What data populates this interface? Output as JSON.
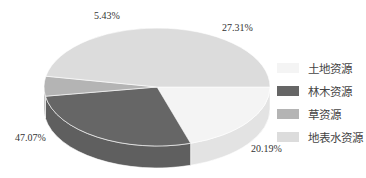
{
  "chart_data": {
    "type": "pie",
    "style": "3d",
    "title": "",
    "categories": [
      "土地资源",
      "林木资源",
      "草资源",
      "地表水资源"
    ],
    "values": [
      20.19,
      27.31,
      5.43,
      47.07
    ],
    "labels": [
      "20.19%",
      "27.31%",
      "5.43%",
      "47.07%"
    ],
    "colors": [
      "#f4f4f4",
      "#666666",
      "#b4b4b4",
      "#dcdcdc"
    ],
    "legend_position": "right"
  },
  "legend": {
    "items": [
      {
        "label": "土地资源",
        "color": "#f4f4f4"
      },
      {
        "label": "林木资源",
        "color": "#666666"
      },
      {
        "label": "草资源",
        "color": "#b4b4b4"
      },
      {
        "label": "地表水资源",
        "color": "#dcdcdc"
      }
    ]
  },
  "data_labels": {
    "land": "20.19%",
    "forest": "27.31%",
    "grass": "5.43%",
    "water": "47.07%"
  }
}
